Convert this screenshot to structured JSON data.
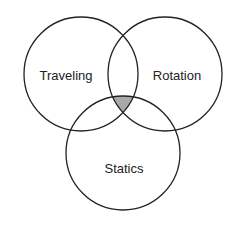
{
  "diagram": {
    "type": "venn",
    "sets": [
      {
        "id": "traveling",
        "label": "Traveling",
        "cx": 81,
        "cy": 74,
        "r": 57,
        "label_x": 66,
        "label_y": 75
      },
      {
        "id": "rotation",
        "label": "Rotation",
        "cx": 165,
        "cy": 74,
        "r": 57,
        "label_x": 177,
        "label_y": 75
      },
      {
        "id": "statics",
        "label": "Statics",
        "cx": 123,
        "cy": 153,
        "r": 57,
        "label_x": 124,
        "label_y": 168
      }
    ],
    "highlighted_region": {
      "description": "Intersection of Traveling, Rotation and Statics",
      "sets": [
        "traveling",
        "rotation",
        "statics"
      ],
      "fill": "#a9a9a9"
    },
    "colors": {
      "stroke": "#222222",
      "background": "#ffffff",
      "highlight": "#a9a9a9"
    }
  }
}
